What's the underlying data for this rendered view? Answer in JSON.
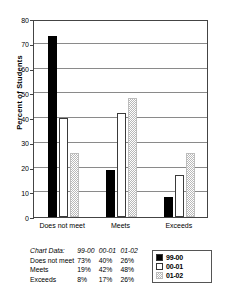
{
  "chart_data": {
    "type": "bar",
    "title": "",
    "xlabel": "",
    "ylabel": "Percent of Students",
    "ylim": [
      0,
      80
    ],
    "ytick_step": 10,
    "yticks": [
      0,
      10,
      20,
      30,
      40,
      50,
      60,
      70,
      80
    ],
    "grid": true,
    "legend_position": "bottom-right",
    "categories": [
      "Does not meet",
      "Meets",
      "Exceeds"
    ],
    "series": [
      {
        "name": "99-00",
        "values": [
          73,
          19,
          8
        ],
        "fill": "solid-black",
        "color": "#000000"
      },
      {
        "name": "00-01",
        "values": [
          40,
          42,
          17
        ],
        "fill": "white-outline",
        "color": "#ffffff"
      },
      {
        "name": "01-02",
        "values": [
          26,
          48,
          26
        ],
        "fill": "light-stipple",
        "color": "#b9b9b9"
      }
    ]
  },
  "table": {
    "caption": "Chart Data:",
    "columns": [
      "99-00",
      "00-01",
      "01-02"
    ],
    "rows": [
      {
        "label": "Does not meet",
        "values": [
          "73%",
          "40%",
          "26%"
        ]
      },
      {
        "label": "Meets",
        "values": [
          "19%",
          "42%",
          "48%"
        ]
      },
      {
        "label": "Exceeds",
        "values": [
          "8%",
          "17%",
          "26%"
        ]
      }
    ]
  },
  "legend": {
    "items": [
      {
        "label": "99-00"
      },
      {
        "label": "00-01"
      },
      {
        "label": "01-02"
      }
    ]
  }
}
